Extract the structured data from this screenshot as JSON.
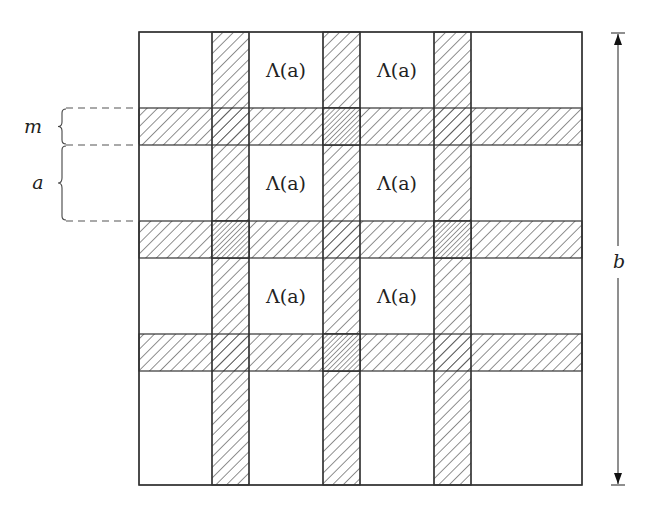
{
  "diagram": {
    "square": {
      "x": 139,
      "y": 32,
      "w": 443,
      "h": 453
    },
    "vertical_stripes": [
      {
        "x": 212,
        "w": 37
      },
      {
        "x": 323,
        "w": 37
      },
      {
        "x": 434,
        "w": 37
      }
    ],
    "horizontal_stripes": [
      {
        "y": 108,
        "h": 37
      },
      {
        "y": 221,
        "h": 37
      },
      {
        "y": 334,
        "h": 37
      }
    ],
    "dense_crossings": [
      {
        "row": 0,
        "col": 1
      },
      {
        "row": 1,
        "col": 0
      },
      {
        "row": 1,
        "col": 2
      },
      {
        "row": 2,
        "col": 1
      }
    ],
    "cell_labels": [
      {
        "text": "Λ(a)",
        "x": 286,
        "y": 77
      },
      {
        "text": "Λ(a)",
        "x": 397,
        "y": 77
      },
      {
        "text": "Λ(a)",
        "x": 286,
        "y": 190
      },
      {
        "text": "Λ(a)",
        "x": 397,
        "y": 190
      },
      {
        "text": "Λ(a)",
        "x": 286,
        "y": 303
      },
      {
        "text": "Λ(a)",
        "x": 397,
        "y": 303
      }
    ],
    "brace_labels": {
      "m": "m",
      "a": "a"
    },
    "dimension_label": "b",
    "colors": {
      "line": "#333333",
      "hatch": "#444444",
      "dashed": "#555555",
      "background": "#ffffff"
    }
  }
}
